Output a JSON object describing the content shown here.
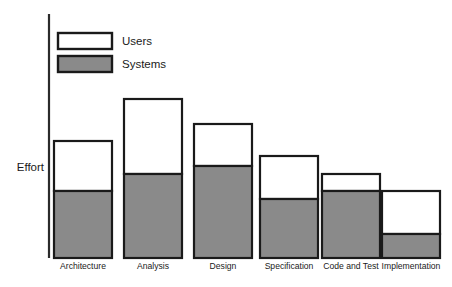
{
  "chart_data": {
    "type": "bar",
    "subtype": "stacked",
    "title": "",
    "xlabel": "",
    "ylabel": "Effort",
    "grid": false,
    "legend_position": "top-left",
    "axis": {
      "y_axis_visible": true,
      "x_axis_visible": false,
      "tick_labels": [],
      "ylim": [
        0,
        100
      ]
    },
    "categories": [
      "Architecture",
      "Analysis",
      "Design",
      "Specification",
      "Code and Test",
      "Implementation"
    ],
    "series": [
      {
        "name": "Systems",
        "color": "#8a8a8a",
        "values": [
          46,
          58,
          64,
          41,
          52,
          17
        ]
      },
      {
        "name": "Users",
        "color": "#ffffff",
        "values": [
          34,
          52,
          29,
          18,
          12,
          29
        ]
      }
    ],
    "totals": [
      80,
      110,
      93,
      59,
      64,
      46
    ],
    "legend": [
      {
        "label": "Users",
        "color": "#ffffff"
      },
      {
        "label": "Systems",
        "color": "#8a8a8a"
      }
    ],
    "geometry": {
      "baseline_y": 258,
      "axis_x": 49,
      "axis_top_y": 14,
      "bar_width": 58,
      "bars": [
        {
          "x": 54,
          "top": 141,
          "divider": 191
        },
        {
          "x": 124,
          "top": 99,
          "divider": 174
        },
        {
          "x": 194,
          "top": 124,
          "divider": 166
        },
        {
          "x": 260,
          "top": 156,
          "divider": 199
        },
        {
          "x": 322,
          "top": 174,
          "divider": 191
        },
        {
          "x": 382,
          "top": 191,
          "divider": 234
        }
      ],
      "label_y": 263,
      "legend_swatch_x": 58,
      "legend_swatch_w": 54,
      "legend_swatch_h": 16,
      "legend_rows_y": [
        33,
        56
      ],
      "legend_text_x": 122,
      "ylabel_x": 44,
      "ylabel_y": 168
    }
  }
}
